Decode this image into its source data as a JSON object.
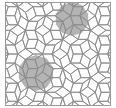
{
  "figure": {
    "type": "penrose-rhombus-tiling",
    "line_color": "#8c8c8c",
    "background_color": "#ffffff",
    "highlight_fill": "#b4b4b4",
    "highlight_regions": [
      {
        "shape": "decagon",
        "center": [
          72,
          19
        ],
        "radius": 17
      },
      {
        "shape": "decagon",
        "center": [
          36,
          73
        ],
        "radius": 18
      }
    ],
    "frame": {
      "x": 5,
      "y": 2,
      "width": 106,
      "height": 104
    }
  }
}
